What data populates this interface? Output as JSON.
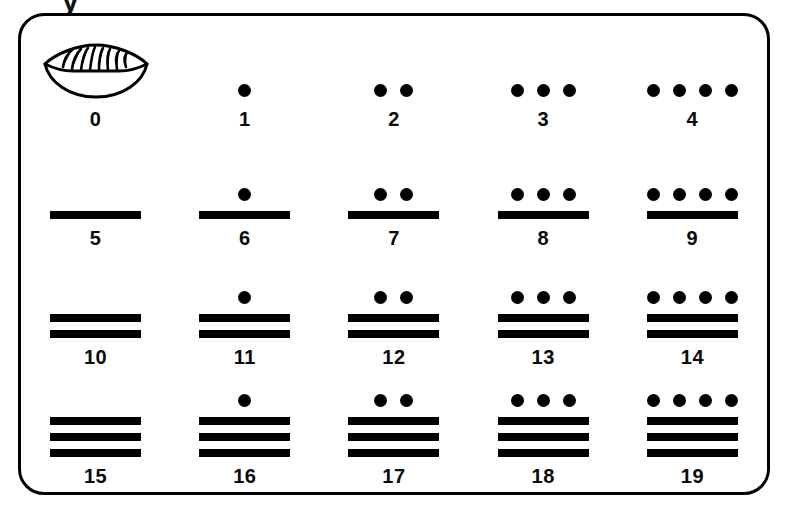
{
  "figure": {
    "title_fragment": "y",
    "frame_color": "#000000",
    "ink_color": "#000000",
    "background": "#ffffff"
  },
  "legend": {
    "dot_value": 1,
    "bar_value": 5,
    "zero_glyph": "shell-icon"
  },
  "chart_data": {
    "type": "table",
    "columns": 5,
    "rows": 4,
    "cells": [
      {
        "label": "0",
        "value": 0,
        "dots": 0,
        "bars": 0,
        "shell": true
      },
      {
        "label": "1",
        "value": 1,
        "dots": 1,
        "bars": 0,
        "shell": false
      },
      {
        "label": "2",
        "value": 2,
        "dots": 2,
        "bars": 0,
        "shell": false
      },
      {
        "label": "3",
        "value": 3,
        "dots": 3,
        "bars": 0,
        "shell": false
      },
      {
        "label": "4",
        "value": 4,
        "dots": 4,
        "bars": 0,
        "shell": false
      },
      {
        "label": "5",
        "value": 5,
        "dots": 0,
        "bars": 1,
        "shell": false
      },
      {
        "label": "6",
        "value": 6,
        "dots": 1,
        "bars": 1,
        "shell": false
      },
      {
        "label": "7",
        "value": 7,
        "dots": 2,
        "bars": 1,
        "shell": false
      },
      {
        "label": "8",
        "value": 8,
        "dots": 3,
        "bars": 1,
        "shell": false
      },
      {
        "label": "9",
        "value": 9,
        "dots": 4,
        "bars": 1,
        "shell": false
      },
      {
        "label": "10",
        "value": 10,
        "dots": 0,
        "bars": 2,
        "shell": false
      },
      {
        "label": "11",
        "value": 11,
        "dots": 1,
        "bars": 2,
        "shell": false
      },
      {
        "label": "12",
        "value": 12,
        "dots": 2,
        "bars": 2,
        "shell": false
      },
      {
        "label": "13",
        "value": 13,
        "dots": 3,
        "bars": 2,
        "shell": false
      },
      {
        "label": "14",
        "value": 14,
        "dots": 4,
        "bars": 2,
        "shell": false
      },
      {
        "label": "15",
        "value": 15,
        "dots": 0,
        "bars": 3,
        "shell": false
      },
      {
        "label": "16",
        "value": 16,
        "dots": 1,
        "bars": 3,
        "shell": false
      },
      {
        "label": "17",
        "value": 17,
        "dots": 2,
        "bars": 3,
        "shell": false
      },
      {
        "label": "18",
        "value": 18,
        "dots": 3,
        "bars": 3,
        "shell": false
      },
      {
        "label": "19",
        "value": 19,
        "dots": 4,
        "bars": 3,
        "shell": false
      }
    ]
  }
}
